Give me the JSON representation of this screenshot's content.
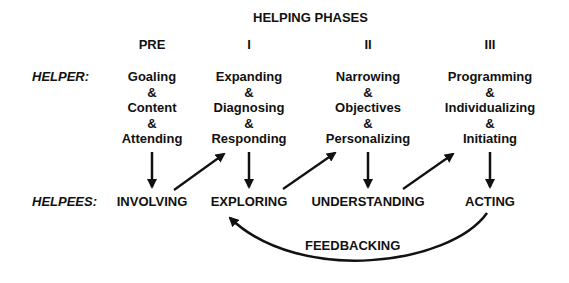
{
  "title": "HELPING PHASES",
  "phases": [
    {
      "label": "PRE"
    },
    {
      "label": "I"
    },
    {
      "label": "II"
    },
    {
      "label": "III"
    }
  ],
  "helper": {
    "label": "HELPER:",
    "columns": [
      [
        "Goaling",
        "&",
        "Content",
        "&",
        "Attending"
      ],
      [
        "Expanding",
        "&",
        "Diagnosing",
        "&",
        "Responding"
      ],
      [
        "Narrowing",
        "&",
        "Objectives",
        "&",
        "Personalizing"
      ],
      [
        "Programming",
        "&",
        "Individualizing",
        "&",
        "Initiating"
      ]
    ]
  },
  "helpees": {
    "label": "HELPEES:",
    "stages": [
      "INVOLVING",
      "EXPLORING",
      "UNDERSTANDING",
      "ACTING"
    ]
  },
  "feedback": {
    "label": "FEEDBACKING"
  },
  "colors": {
    "ink": "#111111",
    "background": "#ffffff"
  }
}
